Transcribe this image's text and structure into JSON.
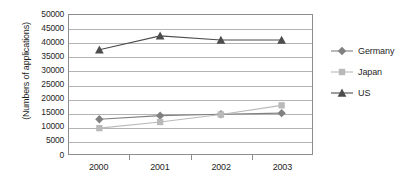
{
  "chart_data": {
    "type": "line",
    "title": "",
    "xlabel": "",
    "ylabel": "(Numbers of applications)",
    "categories": [
      "2000",
      "2001",
      "2002",
      "2003"
    ],
    "ylim": [
      0,
      50000
    ],
    "ytick_step": 5000,
    "yticks": [
      "0",
      "5000",
      "10000",
      "15000",
      "20000",
      "25000",
      "30000",
      "35000",
      "40000",
      "45000",
      "50000"
    ],
    "grid": true,
    "legend_position": "right",
    "series": [
      {
        "name": "Germany",
        "values": [
          12500,
          13800,
          14300,
          14700
        ],
        "color": "#808080",
        "marker": "diamond"
      },
      {
        "name": "Japan",
        "values": [
          9300,
          11500,
          14200,
          17500
        ],
        "color": "#b9b9b9",
        "marker": "square"
      },
      {
        "name": "US",
        "values": [
          37500,
          42500,
          41000,
          41000
        ],
        "color": "#4d4d4d",
        "marker": "triangle"
      }
    ]
  },
  "legend": {
    "items": [
      {
        "label": "Germany"
      },
      {
        "label": "Japan"
      },
      {
        "label": "US"
      }
    ]
  }
}
